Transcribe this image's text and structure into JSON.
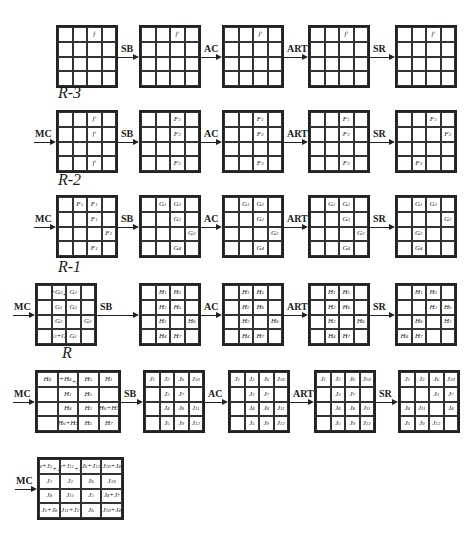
{
  "diagram": {
    "rows": [
      {
        "label": "",
        "lead_op": "",
        "ops": [
          "SB",
          "AC",
          "ART",
          "SR"
        ],
        "states": [
          [
            [
              "",
              "",
              "f",
              ""
            ],
            [
              "",
              "",
              "",
              ""
            ],
            [
              "",
              "",
              "",
              ""
            ],
            [
              "",
              "",
              "",
              ""
            ]
          ],
          [
            [
              "",
              "",
              "f'",
              ""
            ],
            [
              "",
              "",
              "",
              ""
            ],
            [
              "",
              "",
              "",
              ""
            ],
            [
              "",
              "",
              "",
              ""
            ]
          ],
          [
            [
              "",
              "",
              "f'",
              ""
            ],
            [
              "",
              "",
              "",
              ""
            ],
            [
              "",
              "",
              "",
              ""
            ],
            [
              "",
              "",
              "",
              ""
            ]
          ],
          [
            [
              "",
              "",
              "f'",
              ""
            ],
            [
              "",
              "",
              "",
              ""
            ],
            [
              "",
              "",
              "",
              ""
            ],
            [
              "",
              "",
              "",
              ""
            ]
          ],
          [
            [
              "",
              "",
              "f'",
              ""
            ],
            [
              "",
              "",
              "",
              ""
            ],
            [
              "",
              "",
              "",
              ""
            ],
            [
              "",
              "",
              "",
              ""
            ]
          ]
        ]
      },
      {
        "label": "R-3",
        "lead_op": "MC",
        "ops": [
          "SB",
          "AC",
          "ART",
          "SR"
        ],
        "states": [
          [
            [
              "",
              "",
              "f'",
              ""
            ],
            [
              "",
              "",
              "f'",
              ""
            ],
            [
              "",
              "",
              "",
              ""
            ],
            [
              "",
              "",
              "f'",
              ""
            ]
          ],
          [
            [
              "",
              "",
              "F1",
              ""
            ],
            [
              "",
              "",
              "F2",
              ""
            ],
            [
              "",
              "",
              "",
              ""
            ],
            [
              "",
              "",
              "F3",
              ""
            ]
          ],
          [
            [
              "",
              "",
              "F1",
              ""
            ],
            [
              "",
              "",
              "F2",
              ""
            ],
            [
              "",
              "",
              "",
              ""
            ],
            [
              "",
              "",
              "F3",
              ""
            ]
          ],
          [
            [
              "",
              "",
              "F1",
              ""
            ],
            [
              "",
              "",
              "F2",
              ""
            ],
            [
              "",
              "",
              "",
              ""
            ],
            [
              "",
              "",
              "F3",
              ""
            ]
          ],
          [
            [
              "",
              "",
              "F1",
              ""
            ],
            [
              "",
              "",
              "",
              "F2"
            ],
            [
              "",
              "",
              "",
              ""
            ],
            [
              "",
              "F3",
              "",
              ""
            ]
          ]
        ]
      },
      {
        "label": "R-2",
        "lead_op": "MC",
        "ops": [
          "SB",
          "AC",
          "ART",
          "SR"
        ],
        "states": [
          [
            [
              "",
              "F1",
              "F1",
              ""
            ],
            [
              "",
              "",
              "F1",
              ""
            ],
            [
              "",
              "",
              "",
              "F1"
            ],
            [
              "",
              "",
              "F1",
              ""
            ]
          ],
          [
            [
              "",
              "G1",
              "G2",
              ""
            ],
            [
              "",
              "",
              "G3",
              ""
            ],
            [
              "",
              "",
              "",
              "G3"
            ],
            [
              "",
              "",
              "G4",
              ""
            ]
          ],
          [
            [
              "",
              "G1",
              "G2",
              ""
            ],
            [
              "",
              "",
              "G2",
              ""
            ],
            [
              "",
              "",
              "",
              "G3"
            ],
            [
              "",
              "",
              "G4",
              ""
            ]
          ],
          [
            [
              "",
              "G1",
              "G2",
              ""
            ],
            [
              "",
              "",
              "G2",
              ""
            ],
            [
              "",
              "",
              "",
              "G3"
            ],
            [
              "",
              "",
              "G4",
              ""
            ]
          ],
          [
            [
              "",
              "G1",
              "G2",
              ""
            ],
            [
              "",
              "",
              "",
              "G2"
            ],
            [
              "",
              "G3",
              "",
              ""
            ],
            [
              "",
              "G4",
              "",
              ""
            ]
          ]
        ]
      },
      {
        "label": "R-1",
        "lead_op": "MC",
        "ops": [
          "SB",
          "AC",
          "ART",
          "SR"
        ],
        "states": [
          [
            [
              "",
              "G2+G3\n+G4",
              "G1",
              ""
            ],
            [
              "",
              "G1",
              "G2",
              ""
            ],
            [
              "",
              "G3",
              "",
              "G3"
            ],
            [
              "",
              "G3+G4",
              "G1",
              ""
            ]
          ],
          [
            [
              "",
              "H1",
              "H5",
              ""
            ],
            [
              "",
              "H2",
              "H6",
              ""
            ],
            [
              "",
              "H3",
              "",
              "H8"
            ],
            [
              "",
              "H4",
              "H7",
              ""
            ]
          ],
          [
            [
              "",
              "H1",
              "H5",
              ""
            ],
            [
              "",
              "H2",
              "H6",
              ""
            ],
            [
              "",
              "H3",
              "",
              "H8"
            ],
            [
              "",
              "H4",
              "H7",
              ""
            ]
          ],
          [
            [
              "",
              "H1",
              "H5",
              ""
            ],
            [
              "",
              "H2",
              "H6",
              ""
            ],
            [
              "",
              "H3",
              "",
              "H8"
            ],
            [
              "",
              "H4",
              "H7",
              ""
            ]
          ],
          [
            [
              "",
              "H1",
              "H5",
              ""
            ],
            [
              "",
              "",
              "H2",
              "H6"
            ],
            [
              "",
              "H8",
              "",
              "H3"
            ],
            [
              "H4",
              "H7",
              "",
              ""
            ]
          ]
        ]
      },
      {
        "label": "R",
        "lead_op": "MC",
        "ops": [
          "SB",
          "AC",
          "ART",
          "SR"
        ],
        "states": [
          [
            [
              "H4",
              "H7+H8\n+H3",
              "H5",
              "H1"
            ],
            [
              "",
              "H1",
              "H5",
              ""
            ],
            [
              "",
              "H8",
              "H2",
              "H6+H3"
            ],
            [
              "",
              "H6+H2",
              "H5",
              "H7"
            ]
          ],
          [
            [
              "J1",
              "J2",
              "J6",
              "J10"
            ],
            [
              "",
              "J3",
              "J7",
              ""
            ],
            [
              "",
              "J4",
              "J8",
              "J11"
            ],
            [
              "",
              "J5",
              "J9",
              "J12"
            ]
          ],
          [
            [
              "J1",
              "J2",
              "J6",
              "J10"
            ],
            [
              "",
              "J3",
              "J7",
              ""
            ],
            [
              "",
              "J4",
              "J8",
              "J11"
            ],
            [
              "",
              "J5",
              "J9",
              "J12"
            ]
          ],
          [
            [
              "J1",
              "J2",
              "J6",
              "J10"
            ],
            [
              "",
              "J3",
              "J7",
              ""
            ],
            [
              "",
              "J4",
              "J8",
              "J11"
            ],
            [
              "",
              "J5",
              "J9",
              "J12"
            ]
          ],
          [
            [
              "J1",
              "J2",
              "J6",
              "J10"
            ],
            [
              "",
              "",
              "J3",
              "J7"
            ],
            [
              "J8",
              "J11",
              "",
              "J4"
            ],
            [
              "J5",
              "J9",
              "J12",
              ""
            ]
          ]
        ]
      },
      {
        "label": "",
        "lead_op": "MC",
        "ops": [],
        "states": [
          [
            [
              "J8+J5\n+J1",
              "J9+J11\n+J2",
              "J6+J12",
              "J10+J4"
            ],
            [
              "J1",
              "J2",
              "J6",
              "J10"
            ],
            [
              "J8",
              "J11",
              "J3",
              "J4+J7"
            ],
            [
              "J5+J8",
              "J11+J2",
              "J6",
              "J10+J4"
            ]
          ]
        ]
      }
    ]
  }
}
